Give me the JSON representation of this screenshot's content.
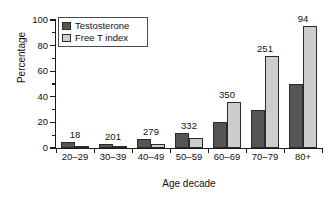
{
  "figure": {
    "cutoff_caption": "",
    "background": "#ffffff"
  },
  "chart_data": {
    "type": "bar",
    "title": "",
    "xlabel": "Age decade",
    "ylabel": "Percentage",
    "categories": [
      "20–29",
      "30–39",
      "40–49",
      "50–59",
      "60–69",
      "70–79",
      "80+"
    ],
    "series": [
      {
        "name": "Testosterone",
        "color": "#555555",
        "values": [
          5,
          3,
          7,
          12,
          20,
          30,
          50
        ]
      },
      {
        "name": "Free T index",
        "color": "#cdcdcd",
        "values": [
          0.5,
          0.5,
          3,
          8,
          36,
          72,
          95
        ]
      }
    ],
    "annotations": {
      "label": "sample size per age decade",
      "values": [
        "18",
        "201",
        "279",
        "332",
        "350",
        "251",
        "94"
      ]
    },
    "ylim": [
      0,
      100
    ],
    "yticks": [
      0,
      20,
      40,
      60,
      80,
      100
    ],
    "ytick_labels": [
      "0",
      "20",
      "40",
      "60",
      "80",
      "100"
    ],
    "yminor_ticks": [
      10,
      30,
      50,
      70,
      90
    ],
    "grid": false,
    "legend_position": "upper left"
  }
}
